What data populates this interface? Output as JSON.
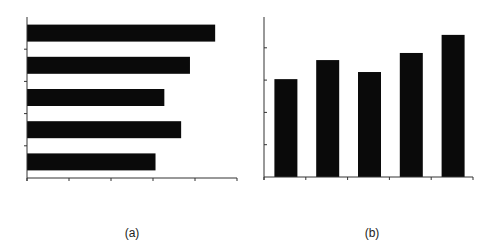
{
  "captions": {
    "a": "(a)",
    "b": "(b)"
  },
  "colors": {
    "bar": "#0a0a0a",
    "axis": "#333333",
    "background": "#ffffff"
  },
  "chart_data": [
    {
      "type": "bar",
      "orientation": "horizontal",
      "label": "(a)",
      "title": "",
      "xlabel": "",
      "ylabel": "",
      "categories": [
        "1",
        "2",
        "3",
        "4",
        "5"
      ],
      "values": [
        4.48,
        3.88,
        3.27,
        3.67,
        3.06
      ],
      "xlim": [
        0,
        5
      ],
      "x_ticks": 6,
      "y_ticks": 5,
      "tick_labels_shown": false,
      "grid": false,
      "legend": null
    },
    {
      "type": "bar",
      "orientation": "vertical",
      "label": "(b)",
      "title": "",
      "xlabel": "",
      "ylabel": "",
      "categories": [
        "1",
        "2",
        "3",
        "4",
        "5"
      ],
      "values": [
        3.03,
        3.62,
        3.25,
        3.84,
        4.4
      ],
      "ylim": [
        0,
        5
      ],
      "x_ticks": 6,
      "y_ticks": 5,
      "tick_labels_shown": false,
      "grid": false,
      "legend": null
    }
  ]
}
